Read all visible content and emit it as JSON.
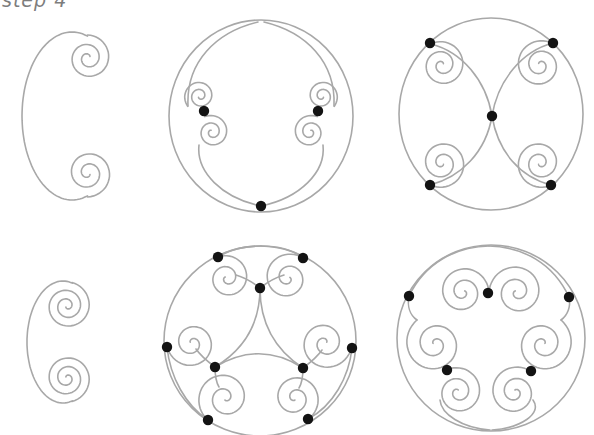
{
  "caption": {
    "text": "step 4"
  },
  "canvas": {
    "width": 594,
    "height": 435
  },
  "style": {
    "stroke_color": "#a8a8a8",
    "dot_color": "#131313",
    "background": "#ffffff",
    "stroke_width": 1.6,
    "dot_radius": 5.2
  },
  "figures": [
    {
      "name": "large-c-scroll",
      "elements": [
        {
          "t": "arc",
          "cx": 72,
          "cy": 116,
          "rx": 50,
          "ry": 84,
          "a0": 72,
          "a1": 288
        },
        {
          "t": "spiral",
          "cx": 88,
          "cy": 58,
          "r1": 23,
          "r0": 2.5,
          "a0": 269,
          "turns": 2.15,
          "dir": 1
        },
        {
          "t": "spiral",
          "cx": 88,
          "cy": 173,
          "r1": 24,
          "r0": 2.5,
          "a0": 91,
          "turns": 2.15,
          "dir": -1
        }
      ],
      "dots": []
    },
    {
      "name": "circle-with-two-scroll-pairs",
      "elements": [
        {
          "t": "ellipse",
          "cx": 261,
          "cy": 116,
          "rx": 92,
          "ry": 96
        },
        {
          "t": "bezier",
          "p": [
            258,
            22,
            216,
            32,
            186,
            62,
            188,
            106
          ]
        },
        {
          "t": "spiral",
          "cx": 200,
          "cy": 96,
          "r1": 16,
          "r0": 2,
          "a0": 140,
          "turns": 2.0,
          "dir": 1
        },
        {
          "t": "bezier",
          "p": [
            261,
            206,
            222,
            198,
            196,
            172,
            199,
            145
          ]
        },
        {
          "t": "spiral",
          "cx": 212,
          "cy": 132,
          "r1": 17,
          "r0": 2,
          "a0": 245,
          "turns": 2.0,
          "dir": 1
        },
        {
          "t": "bezier",
          "p": [
            264,
            22,
            306,
            32,
            336,
            62,
            334,
            106
          ]
        },
        {
          "t": "spiral",
          "cx": 322,
          "cy": 96,
          "r1": 16,
          "r0": 2,
          "a0": 40,
          "turns": 2.0,
          "dir": -1
        },
        {
          "t": "bezier",
          "p": [
            261,
            206,
            300,
            198,
            326,
            172,
            323,
            145
          ]
        },
        {
          "t": "spiral",
          "cx": 310,
          "cy": 132,
          "r1": 17,
          "r0": 2,
          "a0": 295,
          "turns": 2.0,
          "dir": -1
        }
      ],
      "dots": [
        [
          204,
          111
        ],
        [
          318,
          111
        ],
        [
          261,
          206
        ]
      ]
    },
    {
      "name": "circle-with-four-scrolls",
      "elements": [
        {
          "t": "ellipse",
          "cx": 491,
          "cy": 114,
          "rx": 92,
          "ry": 96
        },
        {
          "t": "bezier",
          "p": [
            431,
            44,
            462,
            52,
            486,
            80,
            492,
            116
          ]
        },
        {
          "t": "bezier",
          "p": [
            553,
            43,
            522,
            51,
            498,
            80,
            492,
            116
          ]
        },
        {
          "t": "bezier",
          "p": [
            430,
            185,
            461,
            177,
            486,
            152,
            492,
            116
          ]
        },
        {
          "t": "bezier",
          "p": [
            551,
            185,
            520,
            177,
            498,
            152,
            492,
            116
          ]
        },
        {
          "t": "spiral",
          "cx": 442,
          "cy": 65,
          "r1": 24,
          "r0": 2,
          "a0": 242,
          "turns": 2.2,
          "dir": 1
        },
        {
          "t": "spiral",
          "cx": 540,
          "cy": 65,
          "r1": 25,
          "r0": 2,
          "a0": -60,
          "turns": 2.2,
          "dir": -1
        },
        {
          "t": "spiral",
          "cx": 442,
          "cy": 163,
          "r1": 25,
          "r0": 2,
          "a0": 118,
          "turns": 2.2,
          "dir": -1
        },
        {
          "t": "spiral",
          "cx": 540,
          "cy": 163,
          "r1": 25,
          "r0": 2,
          "a0": 62,
          "turns": 2.2,
          "dir": 1
        }
      ],
      "dots": [
        [
          430,
          43
        ],
        [
          553,
          43
        ],
        [
          492,
          116
        ],
        [
          430,
          185
        ],
        [
          551,
          185
        ]
      ]
    },
    {
      "name": "small-c-scroll",
      "elements": [
        {
          "t": "arc",
          "cx": 63,
          "cy": 342,
          "rx": 36,
          "ry": 61,
          "a0": 75,
          "a1": 285
        },
        {
          "t": "spiral",
          "cx": 67,
          "cy": 306,
          "r1": 24,
          "r0": 1.5,
          "a0": 282,
          "turns": 2.6,
          "dir": 1
        },
        {
          "t": "spiral",
          "cx": 67,
          "cy": 378,
          "r1": 24,
          "r0": 1.5,
          "a0": 78,
          "turns": 2.6,
          "dir": -1
        }
      ],
      "dots": []
    },
    {
      "name": "circle-with-six-scrolls-and-triangle",
      "elements": [
        {
          "t": "ellipse",
          "cx": 260,
          "cy": 341,
          "rx": 96,
          "ry": 95
        },
        {
          "t": "bezier",
          "p": [
            218,
            257,
            230,
            249,
            245,
            246,
            261,
            246
          ]
        },
        {
          "t": "bezier",
          "p": [
            261,
            246,
            277,
            246,
            292,
            249,
            303,
            258
          ]
        },
        {
          "t": "bezier",
          "p": [
            167,
            347,
            170,
            377,
            186,
            406,
            208,
            420
          ]
        },
        {
          "t": "bezier",
          "p": [
            352,
            348,
            349,
            377,
            333,
            406,
            308,
            419
          ]
        },
        {
          "t": "quad",
          "p": [
            260,
            288,
            260,
            340,
            303,
            368
          ]
        },
        {
          "t": "quad",
          "p": [
            260,
            288,
            260,
            340,
            215,
            367
          ]
        },
        {
          "t": "quad",
          "p": [
            215,
            367,
            260,
            340,
            303,
            368
          ]
        },
        {
          "t": "spiral",
          "cx": 227,
          "cy": 278,
          "r1": 23,
          "r0": 2,
          "a0": 247,
          "turns": 1.9,
          "dir": 1
        },
        {
          "t": "spiral",
          "cx": 288,
          "cy": 278,
          "r1": 25,
          "r0": 2,
          "a0": -53,
          "turns": 1.9,
          "dir": -1
        },
        {
          "t": "spiral",
          "cx": 192,
          "cy": 343,
          "r1": 25,
          "r0": 2,
          "a0": 171,
          "turns": 1.9,
          "dir": -1
        },
        {
          "t": "spiral",
          "cx": 325,
          "cy": 343,
          "r1": 27,
          "r0": 2,
          "a0": 10,
          "turns": 1.9,
          "dir": 1
        },
        {
          "t": "spiral",
          "cx": 225,
          "cy": 398,
          "r1": 28,
          "r0": 2,
          "a0": 128,
          "turns": 1.9,
          "dir": 1
        },
        {
          "t": "spiral",
          "cx": 295,
          "cy": 398,
          "r1": 25,
          "r0": 2,
          "a0": 58,
          "turns": 1.9,
          "dir": -1
        },
        {
          "t": "bezier",
          "p": [
            260,
            288,
            251,
            281,
            243,
            277,
            236,
            275
          ]
        },
        {
          "t": "bezier",
          "p": [
            260,
            288,
            269,
            281,
            277,
            277,
            284,
            275
          ]
        },
        {
          "t": "bezier",
          "p": [
            215,
            367,
            207,
            361,
            200,
            355,
            196,
            349
          ]
        },
        {
          "t": "bezier",
          "p": [
            215,
            367,
            215,
            376,
            216,
            382,
            219,
            387
          ]
        },
        {
          "t": "bezier",
          "p": [
            303,
            368,
            311,
            362,
            318,
            356,
            322,
            350
          ]
        },
        {
          "t": "bezier",
          "p": [
            303,
            368,
            303,
            377,
            302,
            383,
            299,
            388
          ]
        }
      ],
      "dots": [
        [
          218,
          257
        ],
        [
          303,
          258
        ],
        [
          167,
          347
        ],
        [
          352,
          348
        ],
        [
          208,
          420
        ],
        [
          308,
          419
        ],
        [
          260,
          288
        ],
        [
          215,
          367
        ],
        [
          303,
          368
        ]
      ]
    },
    {
      "name": "circle-with-six-scrolls",
      "elements": [
        {
          "t": "ellipse",
          "cx": 491,
          "cy": 338,
          "rx": 94,
          "ry": 93
        },
        {
          "t": "bezier",
          "p": [
            409,
            296,
            425,
            263,
            455,
            247,
            489,
            246
          ]
        },
        {
          "t": "bezier",
          "p": [
            489,
            246,
            523,
            247,
            553,
            263,
            569,
            297
          ]
        },
        {
          "t": "bezier",
          "p": [
            409,
            296,
            407,
            306,
            410,
            315,
            417,
            320
          ]
        },
        {
          "t": "bezier",
          "p": [
            569,
            297,
            571,
            306,
            568,
            315,
            561,
            320
          ]
        },
        {
          "t": "bezier",
          "p": [
            490,
            430,
            462,
            428,
            441,
            414,
            440,
            400
          ]
        },
        {
          "t": "bezier",
          "p": [
            492,
            430,
            520,
            428,
            543,
            414,
            533,
            400
          ]
        },
        {
          "t": "spiral",
          "cx": 463,
          "cy": 292,
          "r1": 26,
          "r0": 2,
          "a0": 2,
          "turns": 2.1,
          "dir": -1
        },
        {
          "t": "spiral",
          "cx": 517,
          "cy": 292,
          "r1": 28,
          "r0": 2,
          "a0": 178,
          "turns": 2.1,
          "dir": 1
        },
        {
          "t": "spiral",
          "cx": 435,
          "cy": 344,
          "r1": 30,
          "r0": 2,
          "a0": 233,
          "turns": 2.1,
          "dir": -1
        },
        {
          "t": "spiral",
          "cx": 543,
          "cy": 344,
          "r1": 30,
          "r0": 2,
          "a0": -53,
          "turns": 2.1,
          "dir": 1
        },
        {
          "t": "spiral",
          "cx": 458,
          "cy": 392,
          "r1": 25,
          "r0": 2,
          "a0": 244,
          "turns": 2.1,
          "dir": 1
        },
        {
          "t": "spiral",
          "cx": 515,
          "cy": 392,
          "r1": 26,
          "r0": 2,
          "a0": -53,
          "turns": 2.1,
          "dir": -1
        }
      ],
      "dots": [
        [
          409,
          296
        ],
        [
          569,
          297
        ],
        [
          488,
          293
        ],
        [
          447,
          370
        ],
        [
          531,
          371
        ]
      ]
    }
  ]
}
